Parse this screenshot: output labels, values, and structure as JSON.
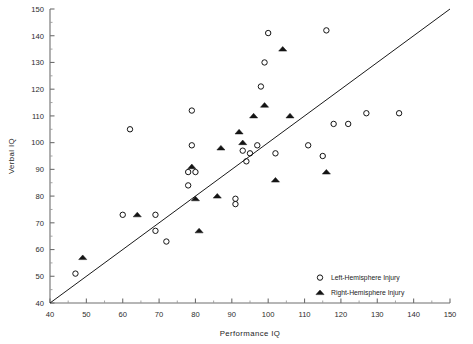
{
  "chart_data": {
    "type": "scatter",
    "title": "",
    "xlabel": "Performance   IQ",
    "ylabel": "Verbal   IQ",
    "xlim": [
      40,
      150
    ],
    "ylim": [
      40,
      150
    ],
    "xticks": [
      40,
      50,
      60,
      70,
      80,
      90,
      100,
      110,
      120,
      130,
      140,
      150
    ],
    "yticks": [
      40,
      50,
      60,
      70,
      80,
      90,
      100,
      110,
      120,
      130,
      140,
      150
    ],
    "xtick_labels": [
      "40",
      "50",
      "60",
      "70",
      "80",
      "90",
      "100",
      "110",
      "120",
      "130",
      "140",
      "150"
    ],
    "ytick_labels": [
      "40",
      "50",
      "60",
      "70",
      "80",
      "90",
      "100",
      "110",
      "120",
      "130",
      "140",
      "150"
    ],
    "minor_tick_step": 5,
    "grid": false,
    "legend_position": "bottom-right",
    "reference_line": {
      "name": "identity-line",
      "from": [
        40,
        40
      ],
      "to": [
        150,
        150
      ]
    },
    "series": [
      {
        "name": "Left-Hemisphere Injury",
        "marker": "open-circle",
        "color": "#141414",
        "points": [
          [
            47,
            51
          ],
          [
            62,
            105
          ],
          [
            69,
            73
          ],
          [
            69,
            67
          ],
          [
            72,
            63
          ],
          [
            60,
            73
          ],
          [
            79,
            112
          ],
          [
            79,
            99
          ],
          [
            78,
            89
          ],
          [
            80,
            89
          ],
          [
            78,
            84
          ],
          [
            91,
            79
          ],
          [
            91,
            77
          ],
          [
            93,
            97
          ],
          [
            95,
            96
          ],
          [
            94,
            93
          ],
          [
            97,
            99
          ],
          [
            98,
            121
          ],
          [
            99,
            130
          ],
          [
            100,
            141
          ],
          [
            102,
            96
          ],
          [
            111,
            99
          ],
          [
            115,
            95
          ],
          [
            116,
            142
          ],
          [
            118,
            107
          ],
          [
            122,
            107
          ],
          [
            127,
            111
          ],
          [
            136,
            111
          ]
        ]
      },
      {
        "name": "Right-Hemisphere Injury",
        "marker": "filled-triangle",
        "color": "#141414",
        "points": [
          [
            49,
            57
          ],
          [
            64,
            73
          ],
          [
            79,
            91
          ],
          [
            80,
            79
          ],
          [
            81,
            67
          ],
          [
            86,
            80
          ],
          [
            87,
            98
          ],
          [
            92,
            104
          ],
          [
            93,
            100
          ],
          [
            96,
            110
          ],
          [
            99,
            114
          ],
          [
            102,
            86
          ],
          [
            104,
            135
          ],
          [
            106,
            110
          ],
          [
            116,
            89
          ]
        ]
      }
    ]
  },
  "legend": {
    "name": "chart-legend",
    "entries": [
      {
        "label": "Left-Hemisphere Injury",
        "marker": "open-circle"
      },
      {
        "label": "Right-Hemisphere Injury",
        "marker": "filled-triangle"
      }
    ]
  }
}
